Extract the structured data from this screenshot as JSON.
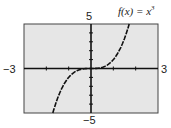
{
  "chart_data": {
    "type": "line",
    "function_label": "f(x) = x",
    "function_exponent": "3",
    "xlabel": "",
    "ylabel": "",
    "xlim": [
      -3,
      3
    ],
    "ylim": [
      -5,
      5
    ],
    "x_tick_labels": {
      "min": "−3",
      "max": "3"
    },
    "y_tick_labels": {
      "min": "−5",
      "max": "5"
    },
    "grid": false,
    "background": "#e6e6e6",
    "series": [
      {
        "name": "f(x) = x^3",
        "x": [
          -1.71,
          -1.5,
          -1.25,
          -1,
          -0.75,
          -0.5,
          -0.25,
          0,
          0.25,
          0.5,
          0.75,
          1,
          1.25,
          1.5,
          1.71
        ],
        "values": [
          -5,
          -3.375,
          -1.953,
          -1,
          -0.422,
          -0.125,
          -0.016,
          0,
          0.016,
          0.125,
          0.422,
          1,
          1.953,
          3.375,
          5
        ]
      }
    ]
  }
}
